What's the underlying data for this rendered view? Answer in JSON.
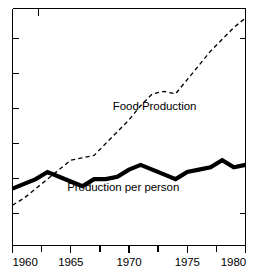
{
  "chart_data": {
    "type": "line",
    "title": "",
    "subtitle": "",
    "xlabel": "",
    "ylabel": "",
    "xlim": [
      1960,
      1980
    ],
    "ylim": [
      0,
      100
    ],
    "grid": false,
    "legend_position": "inline-annotation",
    "x_tick_labels": [
      "1960",
      "1965",
      "1970",
      "1975",
      "1980"
    ],
    "x_tick_values": [
      1960,
      1965,
      1970,
      1975,
      1980
    ],
    "x_minor_tick_values": [
      1961,
      1962,
      1963,
      1964,
      1966,
      1967,
      1968,
      1969,
      1971,
      1972,
      1973,
      1974,
      1976,
      1977,
      1978,
      1979
    ],
    "y_tick_labels": [],
    "y_tick_values": [
      16,
      32,
      48,
      64,
      80,
      96
    ],
    "annotations": [
      {
        "text": "Food Production",
        "x": 1972.2,
        "y": 57
      },
      {
        "text": "Production per person",
        "x": 1969.5,
        "y": 23
      }
    ],
    "series": [
      {
        "name": "Food Production",
        "style": "dashed",
        "x": [
          1960,
          1961,
          1962,
          1963,
          1964,
          1965,
          1966,
          1967,
          1968,
          1969,
          1970,
          1971,
          1972,
          1973,
          1974,
          1975,
          1976,
          1977,
          1978,
          1979,
          1980
        ],
        "values": [
          17,
          20,
          24,
          28,
          32,
          36,
          37,
          38,
          43,
          48,
          53,
          59,
          64,
          65,
          64,
          70,
          76,
          82,
          87,
          92,
          96
        ]
      },
      {
        "name": "Production per person",
        "style": "solid-thick",
        "x": [
          1960,
          1961,
          1962,
          1963,
          1964,
          1965,
          1966,
          1967,
          1968,
          1969,
          1970,
          1971,
          1972,
          1973,
          1974,
          1975,
          1976,
          1977,
          1978,
          1979,
          1980
        ],
        "values": [
          24,
          26,
          28,
          31,
          29,
          27,
          25,
          28,
          28,
          29,
          32,
          34,
          32,
          30,
          28,
          31,
          32,
          33,
          36,
          33,
          34
        ]
      }
    ]
  },
  "annotations": {
    "food_production_label": "Food Production",
    "production_per_person_label": "Production per person"
  },
  "axis": {
    "x_labels": {
      "t1960": "1960",
      "t1965": "1965",
      "t1970": "1970",
      "t1975": "1975",
      "t1980": "1980"
    }
  },
  "colors": {
    "ink": "#000000",
    "background": "#ffffff"
  }
}
